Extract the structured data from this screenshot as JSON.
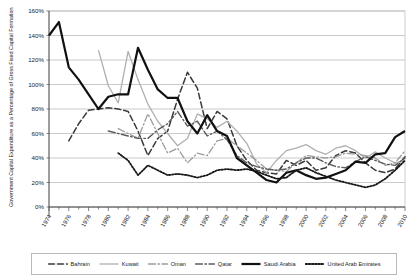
{
  "chart_data": {
    "type": "line",
    "title": "",
    "xlabel": "",
    "ylabel": "Government Capital Expenditure as a Percentage of Gross Fixed Capital Formation",
    "ylim": [
      0,
      160
    ],
    "ytick_labels": [
      "0%",
      "20%",
      "40%",
      "60%",
      "80%",
      "100%",
      "120%",
      "140%",
      "160%"
    ],
    "ytick_values": [
      0,
      20,
      40,
      60,
      80,
      100,
      120,
      140,
      160
    ],
    "xlim": [
      1974,
      2010
    ],
    "xtick_labels": [
      "1974",
      "1976",
      "1978",
      "1980",
      "1982",
      "1984",
      "1986",
      "1988",
      "1990",
      "1992",
      "1994",
      "1996",
      "1998",
      "2000",
      "2002",
      "2004",
      "2006",
      "2008",
      "2010"
    ],
    "grid": "horizontal",
    "legend_position": "bottom",
    "x": [
      1974,
      1975,
      1976,
      1977,
      1978,
      1979,
      1980,
      1981,
      1982,
      1983,
      1984,
      1985,
      1986,
      1987,
      1988,
      1989,
      1990,
      1991,
      1992,
      1993,
      1994,
      1995,
      1996,
      1997,
      1998,
      1999,
      2000,
      2001,
      2002,
      2003,
      2004,
      2005,
      2006,
      2007,
      2008,
      2009,
      2010
    ],
    "series": [
      {
        "name": "Bahrain",
        "style": "dashed",
        "color": "#3a3a3a",
        "width": 1.5,
        "values": [
          null,
          null,
          54,
          68,
          79,
          80,
          81,
          80,
          78,
          62,
          42,
          56,
          62,
          88,
          110,
          97,
          64,
          78,
          72,
          50,
          38,
          30,
          28,
          27,
          38,
          34,
          38,
          30,
          32,
          42,
          46,
          44,
          36,
          30,
          28,
          31,
          41
        ]
      },
      {
        "name": "Kuwait",
        "style": "solid",
        "color": "#b0b0b0",
        "width": 1.3,
        "values": [
          null,
          null,
          null,
          null,
          null,
          128,
          99,
          85,
          127,
          104,
          84,
          70,
          60,
          50,
          56,
          76,
          72,
          65,
          70,
          62,
          52,
          35,
          28,
          38,
          46,
          48,
          51,
          46,
          43,
          48,
          50,
          46,
          40,
          45,
          40,
          36,
          38
        ]
      },
      {
        "name": "Oman",
        "style": "dashdot-light",
        "color": "#9c9c9c",
        "width": 1.3,
        "values": [
          null,
          null,
          null,
          null,
          null,
          null,
          null,
          64,
          60,
          56,
          76,
          60,
          44,
          48,
          36,
          44,
          42,
          54,
          56,
          50,
          44,
          38,
          31,
          30,
          29,
          36,
          42,
          41,
          40,
          41,
          44,
          43,
          42,
          40,
          34,
          36,
          46
        ]
      },
      {
        "name": "Qatar",
        "style": "dashdot-dark",
        "color": "#5c5c5c",
        "width": 1.4,
        "values": [
          null,
          null,
          null,
          null,
          null,
          null,
          62,
          60,
          58,
          56,
          56,
          63,
          68,
          78,
          66,
          70,
          58,
          62,
          55,
          42,
          36,
          33,
          31,
          30,
          31,
          36,
          40,
          40,
          36,
          33,
          32,
          37,
          41,
          38,
          35,
          34,
          40
        ]
      },
      {
        "name": "Saudi Arabia",
        "style": "solid",
        "color": "#111111",
        "width": 2.2,
        "values": [
          140,
          151,
          114,
          104,
          92,
          80,
          90,
          92,
          92,
          130,
          112,
          96,
          89,
          89,
          70,
          60,
          75,
          62,
          58,
          40,
          34,
          28,
          22,
          20,
          28,
          30,
          26,
          23,
          24,
          27,
          30,
          37,
          36,
          43,
          44,
          57,
          62
        ]
      },
      {
        "name": "United Arab Emirates",
        "style": "dotted",
        "color": "#1a1a1a",
        "width": 1.8,
        "values": [
          null,
          null,
          null,
          null,
          null,
          null,
          null,
          44,
          38,
          26,
          34,
          30,
          26,
          27,
          26,
          24,
          26,
          30,
          31,
          30,
          31,
          29,
          26,
          23,
          24,
          30,
          32,
          28,
          25,
          22,
          20,
          18,
          16,
          18,
          23,
          30,
          38
        ]
      }
    ]
  }
}
